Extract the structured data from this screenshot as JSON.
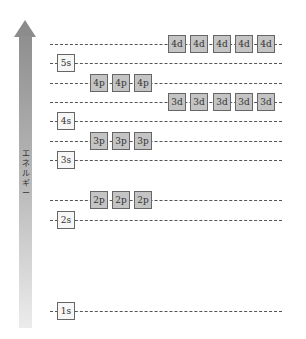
{
  "axis": {
    "label": "エネルギー",
    "direction": "up"
  },
  "levels": [
    {
      "name": "4d",
      "y": 44,
      "type": "d",
      "boxes": [
        "4d",
        "4d",
        "4d",
        "4d",
        "4d"
      ]
    },
    {
      "name": "5s",
      "y": 63,
      "type": "s",
      "boxes": [
        "5s"
      ]
    },
    {
      "name": "4p",
      "y": 83,
      "type": "p",
      "boxes": [
        "4p",
        "4p",
        "4p"
      ]
    },
    {
      "name": "3d",
      "y": 102,
      "type": "d",
      "boxes": [
        "3d",
        "3d",
        "3d",
        "3d",
        "3d"
      ]
    },
    {
      "name": "4s",
      "y": 121,
      "type": "s",
      "boxes": [
        "4s"
      ]
    },
    {
      "name": "3p",
      "y": 141,
      "type": "p",
      "boxes": [
        "3p",
        "3p",
        "3p"
      ]
    },
    {
      "name": "3s",
      "y": 160,
      "type": "s",
      "boxes": [
        "3s"
      ]
    },
    {
      "name": "2p",
      "y": 200,
      "type": "p",
      "boxes": [
        "2p",
        "2p",
        "2p"
      ]
    },
    {
      "name": "2s",
      "y": 220,
      "type": "s",
      "boxes": [
        "2s"
      ]
    },
    {
      "name": "1s",
      "y": 311,
      "type": "s",
      "boxes": [
        "1s"
      ]
    }
  ],
  "colors": {
    "s_box": "#f6f6f6",
    "pd_box": "#c4c4c4",
    "line": "#555555",
    "arrow": "#8f8f8f"
  }
}
